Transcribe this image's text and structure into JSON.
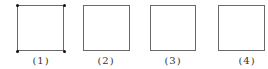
{
  "figures": [
    {
      "label": "(1)",
      "has_corner_points": true
    },
    {
      "label": "(2)",
      "has_corner_points": false
    },
    {
      "label": "(3)",
      "has_corner_points": false
    },
    {
      "label": "(4)",
      "has_corner_points": false
    }
  ],
  "colors": {
    "square_stroke": "#6a6a6a",
    "corner_point": "#111111",
    "label_text": "#333333"
  }
}
